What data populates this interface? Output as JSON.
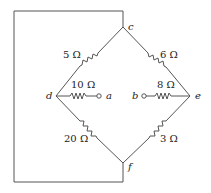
{
  "diagram": {
    "type": "circuit",
    "nodes": {
      "c": "c",
      "d": "d",
      "e": "e",
      "f": "f",
      "a": "a",
      "b": "b"
    },
    "resistors": [
      {
        "id": "r_cd",
        "from": "c",
        "to": "d",
        "label": "5 Ω"
      },
      {
        "id": "r_ce",
        "from": "c",
        "to": "e",
        "label": "6 Ω"
      },
      {
        "id": "r_da",
        "from": "d",
        "to": "a",
        "label": "10 Ω"
      },
      {
        "id": "r_be",
        "from": "b",
        "to": "e",
        "label": "8 Ω"
      },
      {
        "id": "r_df",
        "from": "d",
        "to": "f",
        "label": "20 Ω"
      },
      {
        "id": "r_ef",
        "from": "e",
        "to": "f",
        "label": "3 Ω"
      }
    ],
    "wires": [
      {
        "from": "c",
        "to": "f",
        "note": "outer loop wire around left side"
      }
    ]
  }
}
